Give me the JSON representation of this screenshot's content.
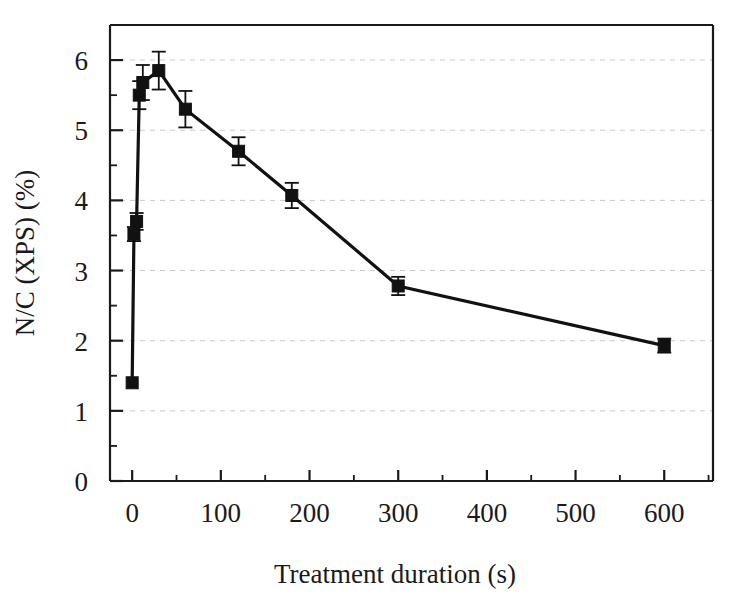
{
  "chart_data": {
    "type": "line",
    "title": "",
    "subtitle": "",
    "xlabel": "Treatment duration (s)",
    "ylabel": "N/C (XPS) (%)",
    "xlim": [
      -25,
      655
    ],
    "ylim": [
      0,
      6.5
    ],
    "grid": true,
    "grid_axis": "y",
    "legend": null,
    "legend_position": "none",
    "marker": "filled-square",
    "line_color": "#111111",
    "marker_color": "#111111",
    "errorbar_color": "#111111",
    "background_color": "#ffffff",
    "xticks": [
      0,
      100,
      200,
      300,
      400,
      500,
      600
    ],
    "xtick_labels": [
      "0",
      "100",
      "200",
      "300",
      "400",
      "500",
      "600"
    ],
    "xticks_minor": [
      50,
      150,
      250,
      350,
      450,
      550,
      650
    ],
    "yticks": [
      0,
      1,
      2,
      3,
      4,
      5,
      6
    ],
    "ytick_labels": [
      "0",
      "1",
      "2",
      "3",
      "4",
      "5",
      "6"
    ],
    "yticks_minor": [
      0.5,
      1.5,
      2.5,
      3.5,
      4.5,
      5.5
    ],
    "series": [
      {
        "name": "N/C (XPS)",
        "x": [
          0,
          2,
          5,
          8,
          12,
          30,
          60,
          120,
          180,
          300,
          600
        ],
        "values": [
          1.4,
          3.52,
          3.7,
          5.5,
          5.68,
          5.85,
          5.3,
          4.7,
          4.07,
          2.78,
          1.93
        ],
        "yerr": [
          0.0,
          0.1,
          0.12,
          0.2,
          0.25,
          0.27,
          0.26,
          0.2,
          0.18,
          0.13,
          0.1
        ]
      }
    ]
  }
}
